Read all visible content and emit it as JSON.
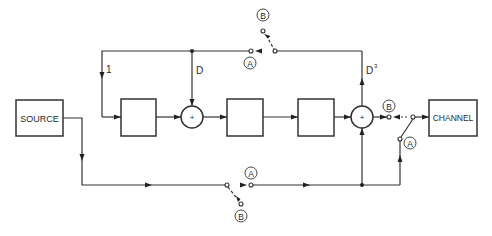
{
  "diagram": {
    "type": "block-diagram",
    "blocks": {
      "source": {
        "label": "SOURCE",
        "x": 16,
        "y": 100,
        "w": 47,
        "h": 36
      },
      "channel": {
        "label": "CHANNEL",
        "x": 429,
        "y": 100,
        "w": 48,
        "h": 36
      },
      "block1": {
        "label": "",
        "x": 121,
        "y": 99,
        "w": 35,
        "h": 37
      },
      "block2": {
        "label": "",
        "x": 227,
        "y": 99,
        "w": 36,
        "h": 37
      },
      "block3": {
        "label": "",
        "x": 298,
        "y": 99,
        "w": 36,
        "h": 37
      }
    },
    "summers": {
      "sum1": {
        "symbol": "+",
        "cx": 192,
        "cy": 117,
        "r": 11
      },
      "sum2": {
        "symbol": "+",
        "cx": 362,
        "cy": 117,
        "r": 11
      }
    },
    "branch_labels": {
      "one": "1",
      "d": "D",
      "d3_base": "D",
      "d3_exp": "3"
    },
    "switch_labels": {
      "top_a": "A",
      "top_b": "B",
      "out_a": "A",
      "out_b": "B",
      "bottom_a": "A",
      "bottom_b": "B"
    },
    "colors": {
      "line": "#333333",
      "background": "#ffffff"
    }
  }
}
